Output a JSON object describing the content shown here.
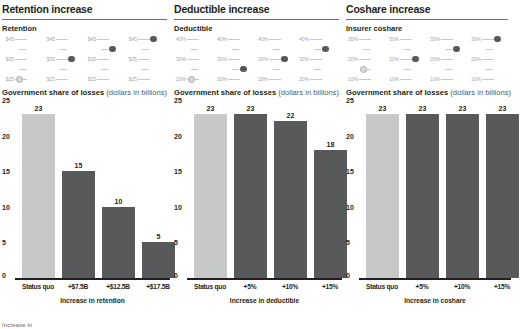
{
  "panels": [
    {
      "title": "Retention increase",
      "slider_label": "Retention",
      "slider_ticks": [
        "$45",
        "$35",
        "$25"
      ],
      "slider_positions": [
        0,
        2,
        3,
        4
      ],
      "chart_data": {
        "type": "bar",
        "title": "Government share of losses",
        "title_note": "(dollars in billions)",
        "categories": [
          "Status quo",
          "+$7.5B",
          "+$12.5B",
          "+$17.5B"
        ],
        "values": [
          23,
          15,
          10,
          5
        ],
        "xlabel": "Increase in retention",
        "ylabel": "",
        "ylim": [
          0,
          25
        ],
        "yticks": [
          25,
          20,
          15,
          10,
          5,
          0
        ],
        "grid": false,
        "legend": ""
      }
    },
    {
      "title": "Deductible increase",
      "slider_label": "Deductible",
      "slider_ticks": [
        "40%",
        "30%",
        "20%"
      ],
      "slider_positions": [
        0,
        1,
        2,
        3
      ],
      "chart_data": {
        "type": "bar",
        "title": "Government share of losses",
        "title_note": "(dollars in billions)",
        "categories": [
          "Status quo",
          "+5%",
          "+10%",
          "+15%"
        ],
        "values": [
          23,
          23,
          22,
          18
        ],
        "xlabel": "Increase in deductible",
        "ylabel": "",
        "ylim": [
          0,
          25
        ],
        "yticks": [
          25,
          20,
          15,
          10,
          5,
          0
        ],
        "grid": false,
        "legend": ""
      }
    },
    {
      "title": "Coshare increase",
      "slider_label": "Insurer coshare",
      "slider_ticks": [
        "30%",
        "20%",
        "10%"
      ],
      "slider_positions": [
        1,
        2,
        3,
        4
      ],
      "chart_data": {
        "type": "bar",
        "title": "Government share of losses",
        "title_note": "(dollars in billions)",
        "categories": [
          "Status quo",
          "+5%",
          "+10%",
          "+15%"
        ],
        "values": [
          23,
          23,
          23,
          23
        ],
        "xlabel": "Increase in coshare",
        "ylabel": "",
        "ylim": [
          0,
          25
        ],
        "yticks": [
          25,
          20,
          15,
          10,
          5,
          0
        ],
        "grid": false,
        "legend": ""
      }
    }
  ],
  "footnote": "Increase in",
  "colors": {
    "bar_status_quo": "#c7c8ca",
    "bar_scenario": "#58595b",
    "text": "#231f20",
    "muted": "#a7a9ac"
  }
}
